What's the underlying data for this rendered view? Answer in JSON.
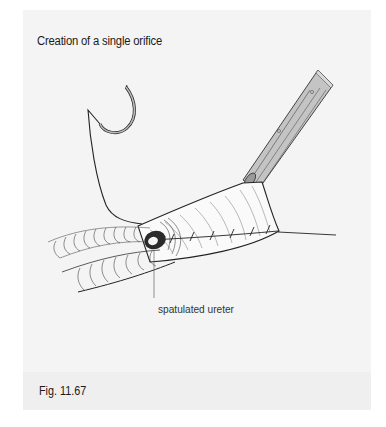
{
  "figure": {
    "title": "Creation of a single orifice",
    "caption": "Fig. 11.67",
    "annotations": [
      {
        "label": "spatulated ureter"
      }
    ]
  },
  "illustration": {
    "elements": [
      "curved-needle",
      "suture-thread",
      "forceps-instrument",
      "ureters",
      "tissue-flap",
      "suture-line"
    ]
  },
  "colors": {
    "page_background": "#ffffff",
    "panel_background": "#f4f4f4",
    "caption_band": "#efefef",
    "ink": "#1a1a1a",
    "instrument_fill": "#bdbdbd"
  }
}
